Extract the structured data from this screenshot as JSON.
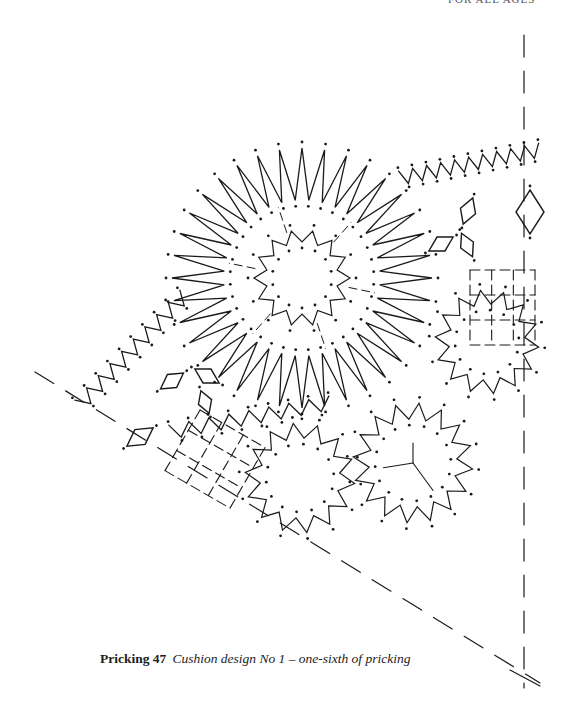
{
  "page": {
    "running_header": "FOR ALL AGES",
    "ink_color": "#1a1a1a",
    "background": "#ffffff"
  },
  "caption": {
    "label": "Pricking 47",
    "description": "Cushion design No 1 – one-sixth of pricking"
  },
  "figure": {
    "title": "Pricking 47",
    "boundary_lines": [
      {
        "name": "vertical-axis",
        "x1": 524,
        "y1": 35,
        "x2": 524,
        "y2": 688
      },
      {
        "name": "diagonal-axis",
        "x1": 35,
        "y1": 372,
        "x2": 540,
        "y2": 683
      }
    ],
    "large_flower": {
      "cx": 302,
      "cy": 278,
      "r_outer": 130,
      "r_inner": 78,
      "r_core_outer": 48,
      "r_core_inner": 36,
      "rays": 36,
      "core_points": 14
    },
    "small_flowers": [
      {
        "cx": 487,
        "cy": 342,
        "r_outer": 52,
        "r_inner": 38,
        "points": 14
      },
      {
        "cx": 300,
        "cy": 478,
        "r_outer": 55,
        "r_inner": 40,
        "points": 14
      },
      {
        "cx": 413,
        "cy": 463,
        "r_outer": 60,
        "r_inner": 44,
        "points": 16
      }
    ],
    "zigzag_edges": [
      {
        "name": "top-edge",
        "points": [
          [
            400,
            178
          ],
          [
            540,
            150
          ]
        ],
        "teeth": 10,
        "amp": 14
      },
      {
        "name": "left-edge",
        "points": [
          [
            80,
            405
          ],
          [
            185,
            295
          ]
        ],
        "teeth": 9,
        "amp": 14
      },
      {
        "name": "lower-left-edge",
        "points": [
          [
            170,
            432
          ],
          [
            330,
            403
          ]
        ],
        "teeth": 8,
        "amp": 14
      }
    ],
    "diamonds": [
      {
        "cx": 530,
        "cy": 212,
        "w": 28,
        "h": 44,
        "rot": 0
      },
      {
        "cx": 468,
        "cy": 211,
        "w": 16,
        "h": 28,
        "rot": 20
      },
      {
        "cx": 441,
        "cy": 244,
        "w": 16,
        "h": 28,
        "rot": 60
      },
      {
        "cx": 467,
        "cy": 245,
        "w": 14,
        "h": 26,
        "rot": -25
      },
      {
        "cx": 172,
        "cy": 381,
        "w": 16,
        "h": 28,
        "rot": 55
      },
      {
        "cx": 207,
        "cy": 376,
        "w": 16,
        "h": 28,
        "rot": -60
      },
      {
        "cx": 205,
        "cy": 402,
        "w": 14,
        "h": 24,
        "rot": -20
      },
      {
        "cx": 140,
        "cy": 437,
        "w": 18,
        "h": 32,
        "rot": 55
      }
    ],
    "grid_areas": [
      {
        "name": "right-grid",
        "x": 470,
        "y": 270,
        "w": 65,
        "h": 75,
        "cols": 3,
        "rows": 3,
        "rot": 0
      },
      {
        "name": "lower-grid",
        "x": 200,
        "y": 410,
        "w": 75,
        "h": 70,
        "cols": 3,
        "rows": 3,
        "rot": 30
      }
    ]
  }
}
